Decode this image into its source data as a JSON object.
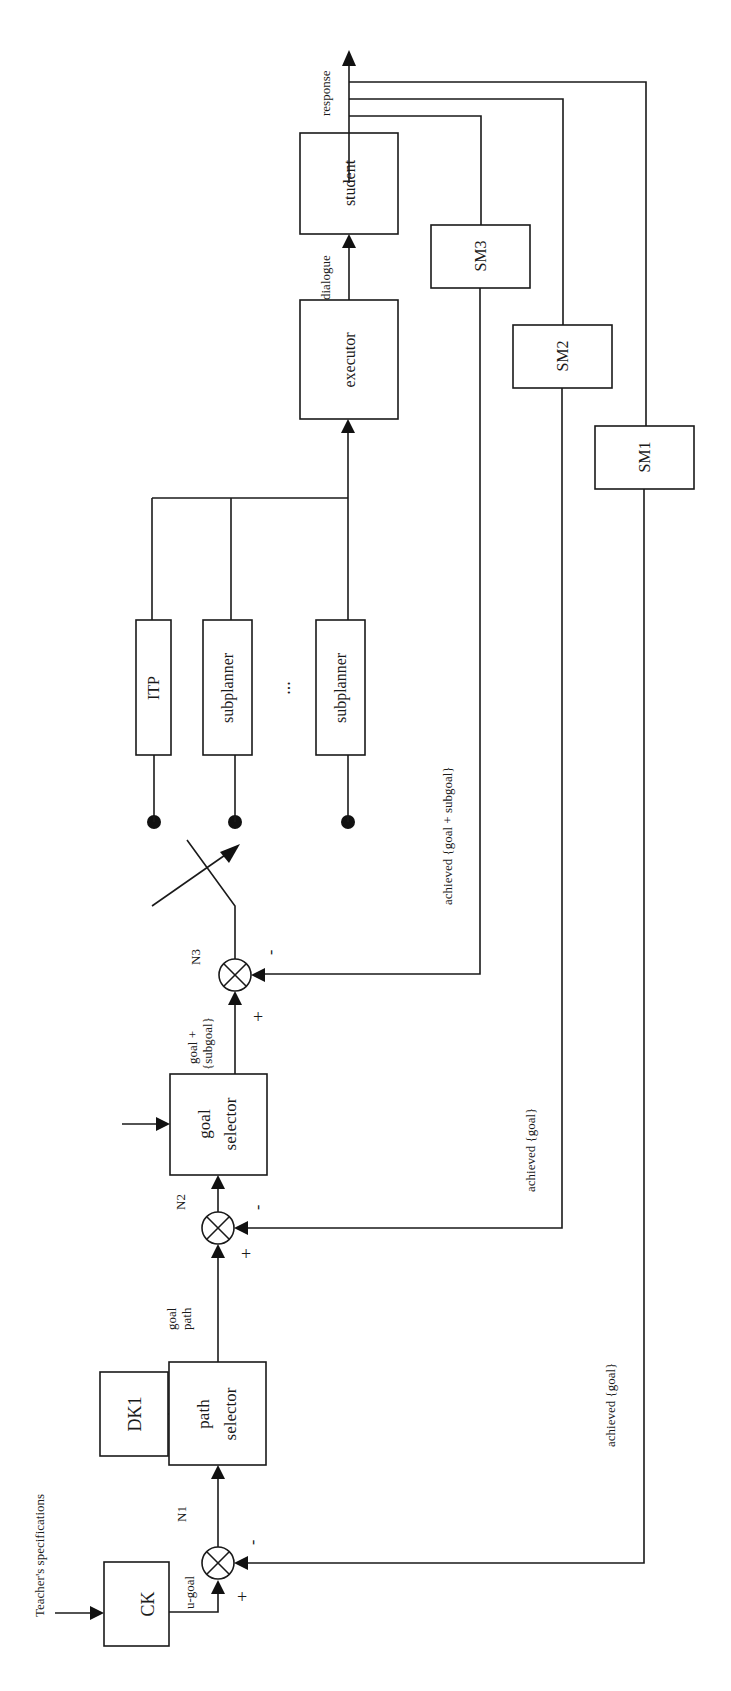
{
  "diagram": {
    "orientation": "rotated 90° counter-clockwise (text reads bottom-to-top)",
    "inputs": {
      "teacher_specs": "Teacher's specifications"
    },
    "blocks": {
      "ck": "CK",
      "dk1": "DK1",
      "path_selector_line1": "path",
      "path_selector_line2": "selector",
      "goal_selector_line1": "goal",
      "goal_selector_line2": "selector",
      "itp": "ITP",
      "subplanner_1": "subplanner",
      "subplanner_2": "subplanner",
      "ellipsis": "...",
      "executor": "executor",
      "student": "student",
      "sm1": "SM1",
      "sm2": "SM2",
      "sm3": "SM3"
    },
    "junctions": {
      "n1": "N1",
      "n2": "N2",
      "n3": "N3",
      "plus": "+",
      "minus": "-"
    },
    "signals": {
      "u_goal": "u-goal",
      "goal_path_line1": "goal",
      "goal_path_line2": "path",
      "goal_subgoal_line1": "goal +",
      "goal_subgoal_line2": "{subgoal}",
      "dialogue": "dialogue",
      "response": "response",
      "fb_n3": "achieved {goal + subgoal}",
      "fb_n2": "achieved {goal}",
      "fb_n1": "achieved {goal}"
    }
  }
}
